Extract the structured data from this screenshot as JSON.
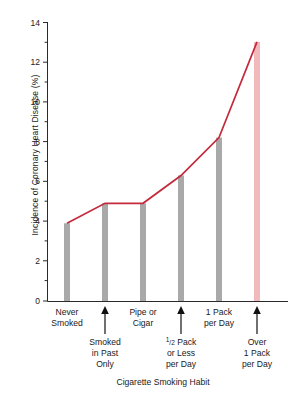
{
  "chart_data": {
    "type": "line",
    "title": "",
    "xlabel": "Cigarette Smoking Habit",
    "ylabel": "Incidence of Coronary Heart Disease (%)",
    "categories": [
      "Never Smoked",
      "Smoked in Past Only",
      "Pipe or Cigar",
      "½ Pack or Less per Day",
      "1 Pack per Day",
      "Over 1 Pack per Day"
    ],
    "values": [
      3.9,
      4.9,
      4.9,
      6.3,
      8.2,
      13.0
    ],
    "ylim": [
      0,
      14
    ],
    "yticks": [
      0,
      2,
      4,
      6,
      8,
      10,
      12,
      14
    ],
    "ytick_labels": [
      "0",
      "2",
      "4",
      "6",
      "8",
      "10",
      "12",
      "14"
    ],
    "minor_ytick_step": 1,
    "grid": false,
    "legend": "none",
    "line_color": "#c42a3c",
    "bar_color": "#a9a9a9",
    "highlight_bar_color": "#f2b9bc",
    "highlight_bar_index": 5,
    "axis_color": "#2a2a2a"
  },
  "axes": {
    "y_tick_labels": [
      "14",
      "12",
      "10",
      "8",
      "6",
      "4",
      "2",
      "0"
    ],
    "y_axis_title": "Incidence of Coronary Heart Disease (%)",
    "x_axis_title": "Cigarette Smoking Habit"
  },
  "x_categories": [
    {
      "id": "never-smoked",
      "row": "top",
      "lines": [
        "Never",
        "Smoked"
      ],
      "arrow": false,
      "value": 3.9
    },
    {
      "id": "smoked-in-past-only",
      "row": "bottom",
      "lines": [
        "Smoked",
        "in Past",
        "Only"
      ],
      "arrow": true,
      "value": 4.9
    },
    {
      "id": "pipe-or-cigar",
      "row": "top",
      "lines": [
        "Pipe or",
        "Cigar"
      ],
      "arrow": false,
      "value": 4.9
    },
    {
      "id": "half-pack-or-less-per-day",
      "row": "bottom",
      "lines": [
        "½ Pack",
        "or Less",
        "per Day"
      ],
      "arrow": true,
      "value": 6.3
    },
    {
      "id": "one-pack-per-day",
      "row": "top",
      "lines": [
        "1 Pack",
        "per Day"
      ],
      "arrow": false,
      "value": 8.2
    },
    {
      "id": "over-one-pack-per-day",
      "row": "bottom",
      "lines": [
        "Over",
        "1 Pack",
        "per Day"
      ],
      "arrow": true,
      "value": 13.0
    }
  ],
  "labels": {
    "y14": "14",
    "y12": "12",
    "y10": "10",
    "y8": "8",
    "y6": "6",
    "y4": "4",
    "y2": "2",
    "y0": "0",
    "c0l0": "Never",
    "c0l1": "Smoked",
    "c1l0": "Smoked",
    "c1l1": "in Past",
    "c1l2": "Only",
    "c2l0": "Pipe or",
    "c2l1": "Cigar",
    "c3l0a": "1",
    "c3l0b": "/2",
    "c3l0c": " Pack",
    "c3l1": "or Less",
    "c3l2": "per Day",
    "c4l0": "1 Pack",
    "c4l1": "per Day",
    "c5l0": "Over",
    "c5l1": "1 Pack",
    "c5l2": "per Day",
    "xtitle": "Cigarette Smoking Habit"
  }
}
